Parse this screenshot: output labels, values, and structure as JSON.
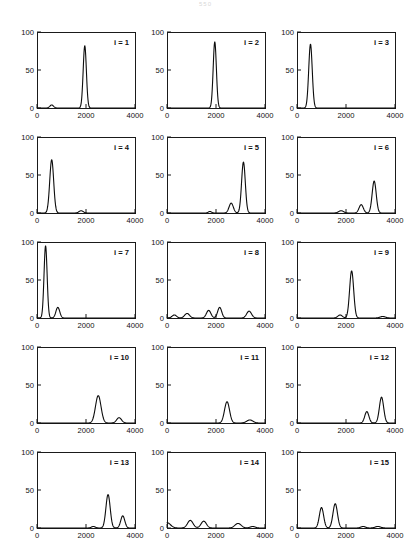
{
  "page": {
    "page_number_faint": "550"
  },
  "figure": {
    "rows": 5,
    "cols": 3,
    "panel_count": 15
  },
  "chart_data": {
    "type": "line",
    "title": "",
    "xlabel": "",
    "ylabel": "",
    "xlim": [
      0,
      4000
    ],
    "ylim": [
      0,
      100
    ],
    "xticks": [
      0,
      2000,
      4000
    ],
    "xtick_labels": [
      "0",
      "2000",
      "4000"
    ],
    "yticks": [
      0,
      50,
      100
    ],
    "ytick_labels": [
      "0",
      "50",
      "100"
    ],
    "grid": false,
    "legend_position": "none",
    "panels": [
      {
        "label": "i = 1",
        "peaks": [
          {
            "x": 600,
            "y": 4,
            "w": 170
          },
          {
            "x": 1950,
            "y": 82,
            "w": 150
          }
        ]
      },
      {
        "label": "i = 2",
        "peaks": [
          {
            "x": 1950,
            "y": 87,
            "w": 150
          }
        ]
      },
      {
        "label": "i = 3",
        "peaks": [
          {
            "x": 550,
            "y": 84,
            "w": 165
          }
        ]
      },
      {
        "label": "i = 4",
        "peaks": [
          {
            "x": 600,
            "y": 70,
            "w": 185
          },
          {
            "x": 1800,
            "y": 3,
            "w": 200
          }
        ]
      },
      {
        "label": "i = 5",
        "peaks": [
          {
            "x": 1750,
            "y": 2,
            "w": 150
          },
          {
            "x": 2620,
            "y": 13,
            "w": 200
          },
          {
            "x": 3120,
            "y": 67,
            "w": 175
          }
        ]
      },
      {
        "label": "i = 6",
        "peaks": [
          {
            "x": 1800,
            "y": 3,
            "w": 230
          },
          {
            "x": 2620,
            "y": 11,
            "w": 200
          },
          {
            "x": 3150,
            "y": 42,
            "w": 190
          }
        ]
      },
      {
        "label": "i = 7",
        "peaks": [
          {
            "x": 350,
            "y": 95,
            "w": 145
          },
          {
            "x": 850,
            "y": 14,
            "w": 180
          }
        ]
      },
      {
        "label": "i = 8",
        "peaks": [
          {
            "x": 300,
            "y": 4,
            "w": 210
          },
          {
            "x": 820,
            "y": 6,
            "w": 230
          },
          {
            "x": 1700,
            "y": 10,
            "w": 210
          },
          {
            "x": 2150,
            "y": 14,
            "w": 190
          },
          {
            "x": 3350,
            "y": 9,
            "w": 230
          }
        ]
      },
      {
        "label": "i = 9",
        "peaks": [
          {
            "x": 1760,
            "y": 4,
            "w": 210
          },
          {
            "x": 2230,
            "y": 62,
            "w": 190
          },
          {
            "x": 3500,
            "y": 2,
            "w": 250
          }
        ]
      },
      {
        "label": "i = 10",
        "peaks": [
          {
            "x": 2500,
            "y": 36,
            "w": 260
          },
          {
            "x": 3350,
            "y": 7,
            "w": 230
          }
        ]
      },
      {
        "label": "i = 11",
        "peaks": [
          {
            "x": 2450,
            "y": 28,
            "w": 235
          },
          {
            "x": 3380,
            "y": 4,
            "w": 290
          }
        ]
      },
      {
        "label": "i = 12",
        "peaks": [
          {
            "x": 2850,
            "y": 15,
            "w": 195
          },
          {
            "x": 3450,
            "y": 34,
            "w": 200
          }
        ]
      },
      {
        "label": "i = 13",
        "peaks": [
          {
            "x": 2300,
            "y": 2,
            "w": 190
          },
          {
            "x": 2900,
            "y": 44,
            "w": 200
          },
          {
            "x": 3500,
            "y": 16,
            "w": 190
          }
        ]
      },
      {
        "label": "i = 14",
        "peaks": [
          {
            "x": 0,
            "y": 7,
            "w": 330
          },
          {
            "x": 950,
            "y": 10,
            "w": 260
          },
          {
            "x": 1500,
            "y": 9,
            "w": 250
          },
          {
            "x": 2900,
            "y": 6,
            "w": 290
          },
          {
            "x": 3500,
            "y": 2,
            "w": 240
          }
        ]
      },
      {
        "label": "i = 15",
        "peaks": [
          {
            "x": 1000,
            "y": 27,
            "w": 200
          },
          {
            "x": 1560,
            "y": 32,
            "w": 210
          },
          {
            "x": 2700,
            "y": 2,
            "w": 220
          },
          {
            "x": 3300,
            "y": 2,
            "w": 260
          }
        ]
      }
    ]
  }
}
